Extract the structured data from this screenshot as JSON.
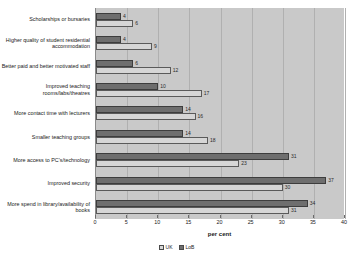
{
  "chart_data": {
    "type": "bar",
    "orientation": "horizontal",
    "title": "",
    "xlabel": "per cent",
    "ylabel": "",
    "xlim": [
      0,
      40
    ],
    "xticks": [
      0,
      5,
      10,
      15,
      20,
      25,
      30,
      35,
      40
    ],
    "grid": true,
    "legend_position": "bottom",
    "categories": [
      "Scholarships or bursaries",
      "Higher quality of student residential accommodation",
      "Better paid and better motivated staff",
      "Improved teaching rooms/labs/theatres",
      "More contact time with lecturers",
      "Smaller teaching groups",
      "More access to PC's/technology",
      "Improved security",
      "More spend in library/availability of books"
    ],
    "series": [
      {
        "name": "UK",
        "color": "#d6d6d6",
        "values": [
          6,
          9,
          12,
          17,
          16,
          18,
          23,
          30,
          31
        ]
      },
      {
        "name": "LoB",
        "color": "#6e6e6e",
        "values": [
          4,
          4,
          6,
          10,
          14,
          14,
          31,
          37,
          34
        ]
      }
    ]
  },
  "legend": {
    "items": [
      {
        "label": "UK"
      },
      {
        "label": "LoB"
      }
    ]
  },
  "axis": {
    "title": "per cent"
  }
}
